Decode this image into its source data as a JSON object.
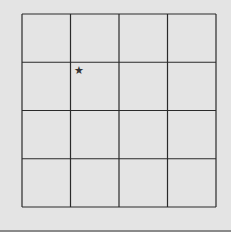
{
  "grid": {
    "rows": 4,
    "cols": 4,
    "left": 22,
    "top": 14,
    "right": 216,
    "bottom": 207,
    "line_color": "#2a2a2a",
    "background": "#e4e4e4"
  },
  "marker": {
    "icon": "star-icon",
    "glyph": "★",
    "row": 1,
    "col": 1,
    "x": 79,
    "y": 70,
    "color": "#333333"
  }
}
